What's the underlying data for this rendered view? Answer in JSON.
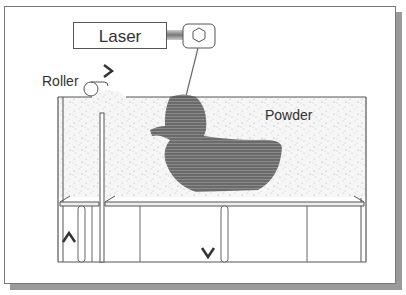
{
  "diagram": {
    "title_partial": "",
    "laser": {
      "label": "Laser",
      "icon": "hexagon-lens-icon"
    },
    "roller": {
      "label": "Roller",
      "direction": "right"
    },
    "powder": {
      "label": "Powder"
    },
    "part_shape": "duck",
    "arrows": {
      "feed_piston": "up",
      "build_piston": "down"
    },
    "colors": {
      "outline": "#555555",
      "part": "#6b6b6b",
      "powder_bg": "#f4f4f4",
      "shadow": "#9a9a9a"
    }
  }
}
